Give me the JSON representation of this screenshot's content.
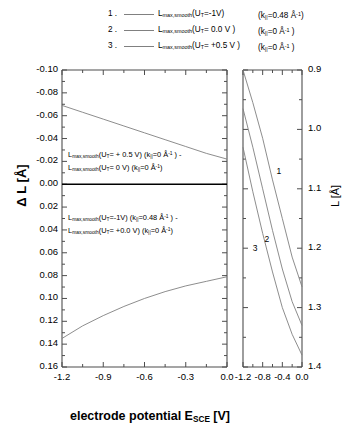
{
  "figure": {
    "background": "#ffffff",
    "axis_color": "#4d4d4d",
    "curve_color": "#808080"
  },
  "legend": {
    "items": [
      {
        "number": "1 .",
        "label_base": "L",
        "label_sub": "max,smooth",
        "label_arg": "(U",
        "label_arg_sub": "T",
        "label_arg_rest": "=-1V)",
        "k_prefix": "(k",
        "k_sub": "||",
        "k_value": "=0.48 Å",
        "k_exp": "-1",
        "k_suffix": ")"
      },
      {
        "number": "2 .",
        "label_base": "L",
        "label_sub": "max,smooth",
        "label_arg": "(U",
        "label_arg_sub": "T",
        "label_arg_rest": "= 0.0 V )",
        "k_prefix": "(k",
        "k_sub": "||",
        "k_value": "=0 Å",
        "k_exp": "-1",
        "k_suffix": " )"
      },
      {
        "number": "3 .",
        "label_base": "L",
        "label_sub": "max,smooth",
        "label_arg": "(U",
        "label_arg_sub": "T",
        "label_arg_rest": "= +0.5 V )",
        "k_prefix": "(k",
        "k_sub": "||",
        "k_value": "=0 Å",
        "k_exp": "-1",
        "k_suffix": " )"
      }
    ]
  },
  "left_panel": {
    "y_axis_title_delta": "Δ L [Å]",
    "y_ticklabels": [
      "-0.10",
      "-0.08",
      "-0.06",
      "-0.04",
      "-0.02",
      "0.00",
      "0.02",
      "0.04",
      "0.06",
      "0.08",
      "0.10",
      "0.12",
      "0.14",
      "0.16"
    ],
    "x_ticklabels": [
      "-1.2",
      "-0.9",
      "-0.6",
      "-0.3",
      "0.0"
    ],
    "annotation_upper": {
      "line1_a": "L",
      "line1_sub": "max,smooth",
      "line1_b": "(U",
      "line1_bsub": "T",
      "line1_c": "= + 0.5 V) (k",
      "line1_ksub": "||",
      "line1_d": "=0 Å",
      "line1_exp": "-1",
      "line1_e": " ) -",
      "line2_a": "L",
      "line2_sub": "max,smooth",
      "line2_b": "(U",
      "line2_bsub": "T",
      "line2_c": "=  0 V) (k",
      "line2_ksub": "||",
      "line2_d": "=0 Å",
      "line2_exp": "-1",
      "line2_e": ")"
    },
    "annotation_lower": {
      "line1_a": "L",
      "line1_sub": "max,smooth",
      "line1_b": "(U",
      "line1_bsub": "T",
      "line1_c": "=-1V) (k",
      "line1_ksub": "||",
      "line1_d": "=0.48 Å",
      "line1_exp": "-1",
      "line1_e": " ) -",
      "line2_a": "L",
      "line2_sub": "max,smooth",
      "line2_b": "(U",
      "line2_bsub": "T",
      "line2_c": "= +0.0 V) (k",
      "line2_ksub": "||",
      "line2_d": "=0 Å",
      "line2_exp": "-1",
      "line2_e": ")"
    }
  },
  "right_panel": {
    "y_axis_title": "L [Å]",
    "y_ticklabels": [
      "1.4",
      "1.3",
      "1.2",
      "1.1",
      "1.0",
      "0.9"
    ],
    "x_ticklabels": [
      "-1.2",
      "-0.8",
      "-0.4",
      "0.0"
    ],
    "curve_labels": [
      "1",
      "2",
      "3"
    ]
  },
  "x_axis_title": {
    "text_main": "electrode potential  E",
    "text_sub": "SCE",
    "text_unit": "  [V]"
  },
  "chart_data": {
    "type": "line",
    "title": "",
    "panels": [
      {
        "name": "left",
        "xlabel": "electrode potential E_SCE [V]",
        "ylabel": "Δ L [Å]",
        "xlim": [
          -1.2,
          0.0
        ],
        "ylim": [
          -0.1,
          0.16
        ],
        "y_inverted": true,
        "xticks": [
          -1.2,
          -0.9,
          -0.6,
          -0.3,
          0.0
        ],
        "yticks": [
          -0.1,
          -0.08,
          -0.06,
          -0.04,
          -0.02,
          0.0,
          0.02,
          0.04,
          0.06,
          0.08,
          0.1,
          0.12,
          0.14,
          0.16
        ],
        "grid": false,
        "series": [
          {
            "name": "L_max,smooth(U_T=+0.5V, k=0) - L_max,smooth(U_T=0V, k=0)",
            "x": [
              -1.2,
              -1.05,
              -0.9,
              -0.75,
              -0.6,
              -0.45,
              -0.3,
              -0.15,
              0.0
            ],
            "y": [
              -0.069,
              -0.063,
              -0.057,
              -0.051,
              -0.045,
              -0.039,
              -0.033,
              -0.027,
              -0.022
            ]
          },
          {
            "name": "zero-line",
            "x": [
              -1.2,
              0.0
            ],
            "y": [
              0.0,
              0.0
            ]
          },
          {
            "name": "L_max,smooth(U_T=-1V, k=0.48) - L_max,smooth(U_T=+0.0V, k=0)",
            "x": [
              -1.2,
              -1.05,
              -0.9,
              -0.75,
              -0.6,
              -0.45,
              -0.3,
              -0.15,
              0.0
            ],
            "y": [
              0.135,
              0.124,
              0.115,
              0.107,
              0.1,
              0.094,
              0.089,
              0.085,
              0.081
            ]
          }
        ]
      },
      {
        "name": "right",
        "xlabel": "electrode potential E_SCE [V]",
        "ylabel": "L [Å]",
        "xlim": [
          -1.2,
          0.0
        ],
        "ylim": [
          0.9,
          1.4
        ],
        "y_inverted": false,
        "xticks": [
          -1.2,
          -0.8,
          -0.4,
          0.0
        ],
        "yticks": [
          0.9,
          1.0,
          1.1,
          1.2,
          1.3,
          1.4
        ],
        "grid": false,
        "series": [
          {
            "name": "1",
            "x": [
              -1.2,
              -1.0,
              -0.8,
              -0.6,
              -0.4,
              -0.2,
              0.0
            ],
            "y": [
              1.4,
              1.345,
              1.285,
              1.215,
              1.15,
              1.085,
              1.035
            ]
          },
          {
            "name": "2",
            "x": [
              -1.2,
              -1.0,
              -0.8,
              -0.6,
              -0.4,
              -0.2,
              0.0
            ],
            "y": [
              1.335,
              1.27,
              1.2,
              1.13,
              1.065,
              1.01,
              0.97
            ]
          },
          {
            "name": "3",
            "x": [
              -1.2,
              -1.0,
              -0.8,
              -0.6,
              -0.4,
              -0.2,
              0.0
            ],
            "y": [
              1.27,
              1.195,
              1.125,
              1.06,
              1.0,
              0.955,
              0.92
            ]
          }
        ]
      }
    ]
  }
}
